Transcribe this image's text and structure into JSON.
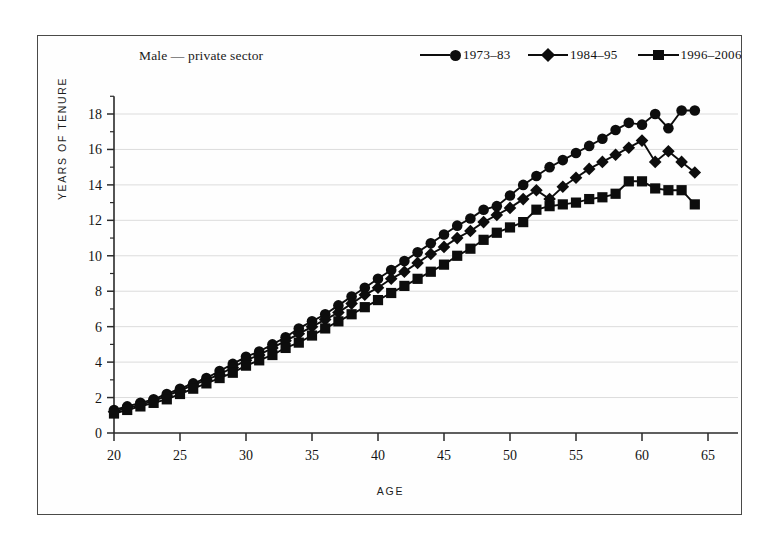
{
  "figure": {
    "panel_label": "Male — private sector",
    "background": "#ffffff",
    "frame_color": "#4a4a48",
    "ink_color": "#0d0d0d",
    "grid_color": "#dcdcdc"
  },
  "legend": {
    "position": "top-right",
    "entries": [
      {
        "label": "1973–83",
        "marker": "circle",
        "name": "legend-series-1973-83"
      },
      {
        "label": "1984–95",
        "marker": "diamond",
        "name": "legend-series-1984-95"
      },
      {
        "label": "1996–2006",
        "marker": "square",
        "name": "legend-series-1996-2006"
      }
    ]
  },
  "chart_data": {
    "type": "line",
    "title": "Male — private sector",
    "xlabel": "AGE",
    "ylabel": "YEARS OF TENURE",
    "xlim": [
      19,
      65
    ],
    "ylim": [
      0,
      19
    ],
    "xticks": [
      20,
      25,
      30,
      35,
      40,
      45,
      50,
      55,
      60,
      65
    ],
    "yticks": [
      0,
      2,
      4,
      6,
      8,
      10,
      12,
      14,
      16,
      18
    ],
    "grid": "horizontal",
    "legend_position": "top-right",
    "x": [
      20,
      21,
      22,
      23,
      24,
      25,
      26,
      27,
      28,
      29,
      30,
      31,
      32,
      33,
      34,
      35,
      36,
      37,
      38,
      39,
      40,
      41,
      42,
      43,
      44,
      45,
      46,
      47,
      48,
      49,
      50,
      51,
      52,
      53,
      54,
      55,
      56,
      57,
      58,
      59,
      60,
      61,
      62,
      63,
      64
    ],
    "series": [
      {
        "name": "1973–83",
        "marker": "circle",
        "values": [
          1.3,
          1.5,
          1.7,
          1.9,
          2.2,
          2.5,
          2.8,
          3.1,
          3.5,
          3.9,
          4.3,
          4.6,
          5.0,
          5.4,
          5.9,
          6.3,
          6.7,
          7.2,
          7.7,
          8.2,
          8.7,
          9.2,
          9.7,
          10.2,
          10.7,
          11.2,
          11.7,
          12.1,
          12.6,
          12.8,
          13.4,
          14.0,
          14.5,
          15.0,
          15.4,
          15.8,
          16.2,
          16.6,
          17.1,
          17.5,
          17.4,
          18.0,
          17.2,
          18.2,
          18.2
        ]
      },
      {
        "name": "1984–95",
        "marker": "diamond",
        "values": [
          1.2,
          1.4,
          1.6,
          1.8,
          2.1,
          2.4,
          2.7,
          3.0,
          3.3,
          3.7,
          4.1,
          4.4,
          4.8,
          5.2,
          5.6,
          6.0,
          6.4,
          6.8,
          7.3,
          7.8,
          8.2,
          8.7,
          9.1,
          9.6,
          10.1,
          10.5,
          11.0,
          11.4,
          11.9,
          12.3,
          12.7,
          13.2,
          13.7,
          13.2,
          13.9,
          14.4,
          14.9,
          15.3,
          15.7,
          16.1,
          16.5,
          15.3,
          15.9,
          15.3,
          14.7
        ]
      },
      {
        "name": "1996–2006",
        "marker": "square",
        "values": [
          1.1,
          1.3,
          1.5,
          1.7,
          1.9,
          2.2,
          2.5,
          2.8,
          3.1,
          3.4,
          3.8,
          4.1,
          4.4,
          4.8,
          5.1,
          5.5,
          5.9,
          6.3,
          6.7,
          7.1,
          7.5,
          7.9,
          8.3,
          8.7,
          9.1,
          9.5,
          10.0,
          10.4,
          10.9,
          11.3,
          11.6,
          11.9,
          12.6,
          12.8,
          12.9,
          13.0,
          13.2,
          13.3,
          13.5,
          14.2,
          14.2,
          13.8,
          13.7,
          13.7,
          12.9
        ]
      }
    ]
  }
}
